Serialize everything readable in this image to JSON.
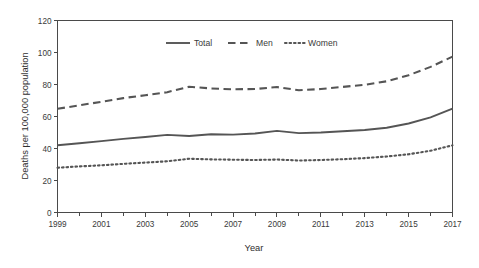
{
  "chart_data": {
    "type": "line",
    "title": "",
    "xlabel": "Year",
    "ylabel": "Deaths per 100,000 population",
    "x": [
      1999,
      2000,
      2001,
      2002,
      2003,
      2004,
      2005,
      2006,
      2007,
      2008,
      2009,
      2010,
      2011,
      2012,
      2013,
      2014,
      2015,
      2016,
      2017
    ],
    "xlim": [
      1999,
      2017
    ],
    "ylim": [
      0,
      120
    ],
    "yticks": [
      0,
      20,
      40,
      60,
      80,
      100,
      120
    ],
    "xticks_labeled": [
      1999,
      2001,
      2003,
      2005,
      2007,
      2009,
      2011,
      2013,
      2015,
      2017
    ],
    "xticks_minor": [
      2000,
      2002,
      2004,
      2006,
      2008,
      2010,
      2012,
      2014,
      2016
    ],
    "grid": false,
    "legend_position": "top-center",
    "series": [
      {
        "name": "Total",
        "style": "solid",
        "values": [
          42.0,
          43.3,
          44.6,
          46.0,
          47.2,
          48.5,
          47.8,
          48.9,
          48.7,
          49.4,
          51.0,
          49.6,
          50.0,
          50.8,
          51.6,
          53.0,
          55.6,
          59.4,
          64.9
        ]
      },
      {
        "name": "Men",
        "style": "dashed",
        "values": [
          64.8,
          67.0,
          69.2,
          71.5,
          73.3,
          75.2,
          78.6,
          77.5,
          77.0,
          77.2,
          78.4,
          76.4,
          77.2,
          78.5,
          79.8,
          82.0,
          85.8,
          91.0,
          97.4
        ]
      },
      {
        "name": "Women",
        "style": "dotted",
        "values": [
          28.0,
          28.8,
          29.5,
          30.4,
          31.2,
          32.0,
          33.6,
          33.2,
          33.0,
          32.8,
          33.1,
          32.5,
          32.8,
          33.3,
          34.0,
          35.0,
          36.4,
          38.6,
          42.0
        ]
      }
    ],
    "colors": {
      "total": "#555555",
      "men": "#555555",
      "women": "#555555",
      "axis": "#4a4a4a",
      "background": "#ffffff"
    }
  },
  "legend": {
    "items": [
      {
        "label": "Total",
        "style": "solid"
      },
      {
        "label": "Men",
        "style": "dashed"
      },
      {
        "label": "Women",
        "style": "dotted"
      }
    ]
  },
  "axes": {
    "y_title": "Deaths per 100,000 population",
    "x_title": "Year",
    "y_tick_labels": [
      "0",
      "20",
      "40",
      "60",
      "80",
      "100",
      "120"
    ],
    "x_tick_labels": [
      "1999",
      "2001",
      "2003",
      "2005",
      "2007",
      "2009",
      "2011",
      "2013",
      "2015",
      "2017"
    ]
  }
}
